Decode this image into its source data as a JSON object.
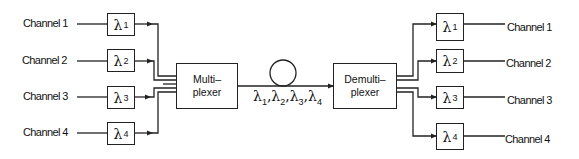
{
  "diagram": {
    "type": "WDM multiplexing / demultiplexing block diagram",
    "inputs": [
      {
        "label": "Channel 1",
        "filter": "λ",
        "sub": "1"
      },
      {
        "label": "Channel 2",
        "filter": "λ",
        "sub": "2"
      },
      {
        "label": "Channel 3",
        "filter": "λ",
        "sub": "3"
      },
      {
        "label": "Channel 4",
        "filter": "λ",
        "sub": "4"
      }
    ],
    "multiplexer": {
      "line1": "Multi–",
      "line2": "plexer"
    },
    "fiber": {
      "label_symbol": "λ",
      "subs": [
        "1",
        "2",
        "3",
        "4"
      ],
      "separator": ","
    },
    "demultiplexer": {
      "line1": "Demulti–",
      "line2": "plexer"
    },
    "outputs": [
      {
        "label": "Channel 1",
        "filter": "λ",
        "sub": "1"
      },
      {
        "label": "Channel 2",
        "filter": "λ",
        "sub": "2"
      },
      {
        "label": "Channel 3",
        "filter": "λ",
        "sub": "3"
      },
      {
        "label": "Channel 4",
        "filter": "λ",
        "sub": "4"
      }
    ],
    "colors": {
      "line": "#222222",
      "background": "#ffffff"
    }
  }
}
